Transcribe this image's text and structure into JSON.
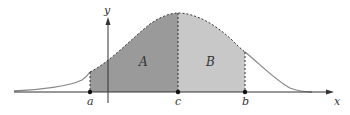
{
  "diagram": {
    "type": "area-under-curve",
    "axes": {
      "x_label": "x",
      "y_label": "y"
    },
    "points": [
      {
        "name": "a",
        "label": "a"
      },
      {
        "name": "c",
        "label": "c"
      },
      {
        "name": "b",
        "label": "b"
      }
    ],
    "regions": [
      {
        "name": "A",
        "label": "A",
        "from": "a",
        "to": "c",
        "color": "#9a9a9a"
      },
      {
        "name": "B",
        "label": "B",
        "from": "c",
        "to": "b",
        "color": "#c8c8c8"
      }
    ],
    "colors": {
      "curve": "#888888",
      "curve_dashed": "#333333",
      "axis": "#333333",
      "region_A": "#9a9a9a",
      "region_B": "#c8c8c8"
    }
  }
}
